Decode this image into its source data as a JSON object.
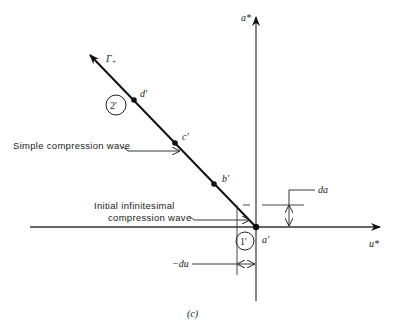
{
  "figure": {
    "caption": "(c)",
    "axes": {
      "horizontal_label": "u*",
      "vertical_label": "a*"
    },
    "characteristic": {
      "label": "Γ+",
      "label_main": "Γ",
      "label_sub": "+",
      "points": [
        {
          "name": "a'",
          "label": "a'"
        },
        {
          "name": "b'",
          "label": "b'"
        },
        {
          "name": "c'",
          "label": "c'"
        },
        {
          "name": "d'",
          "label": "d'"
        }
      ]
    },
    "regions": [
      {
        "label": "1'"
      },
      {
        "label": "2'"
      }
    ],
    "annotations": {
      "simple_wave": "Simple compression wave",
      "initial_wave_line1": "Initial infinitesimal",
      "initial_wave_line2": "compression wave",
      "da": "da",
      "neg_du": "−du"
    },
    "colors": {
      "line": "#111111",
      "axis": "#333333",
      "background": "#ffffff"
    }
  }
}
